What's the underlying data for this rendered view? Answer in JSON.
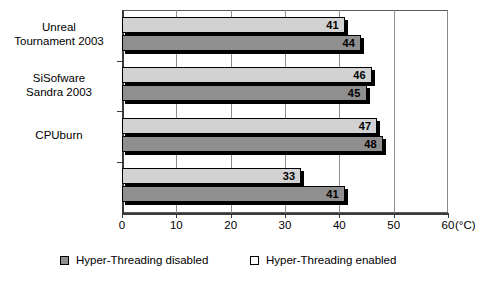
{
  "chart_data": {
    "type": "bar",
    "orientation": "horizontal",
    "title": "",
    "xlabel": "(°C)",
    "ylabel": "",
    "xlim": [
      0,
      60
    ],
    "xticks": [
      0,
      10,
      20,
      30,
      40,
      50,
      60
    ],
    "xtick_labels": [
      "0",
      "10",
      "20",
      "30",
      "40",
      "50",
      "60"
    ],
    "unit": "(°C)",
    "grid": true,
    "grid_axis": "x",
    "legend_position": "bottom",
    "categories": [
      "Unreal\nTournament 2003",
      "SiSofware\nSandra 2003",
      "CPUburn",
      ""
    ],
    "series": [
      {
        "name": "Hyper-Threading enabled",
        "color": "#d2d2d2",
        "values": [
          41,
          46,
          47,
          33
        ]
      },
      {
        "name": "Hyper-Threading disabled",
        "color": "#8f8f8f",
        "values": [
          44,
          45,
          48,
          41
        ]
      }
    ]
  },
  "legend": {
    "entries": [
      {
        "label": "Hyper-Threading disabled",
        "swatch": "disabled"
      },
      {
        "label": "Hyper-Threading enabled",
        "swatch": "enabled"
      }
    ]
  }
}
